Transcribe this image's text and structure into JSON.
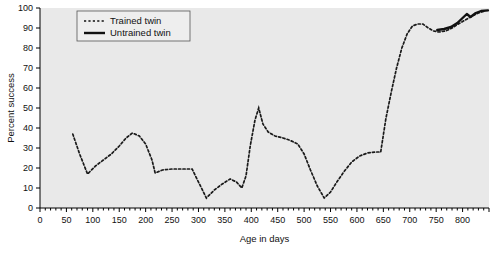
{
  "chart_data": {
    "type": "line",
    "title": "",
    "xlabel": "Age in days",
    "ylabel": "Percent success",
    "xlim": [
      0,
      850
    ],
    "ylim": [
      0,
      100
    ],
    "xticks": [
      0,
      50,
      100,
      150,
      200,
      250,
      300,
      350,
      400,
      450,
      500,
      550,
      600,
      650,
      700,
      750,
      800
    ],
    "yticks": [
      0,
      10,
      20,
      30,
      40,
      50,
      60,
      70,
      80,
      90,
      100
    ],
    "grid": false,
    "legend_position": "top-left",
    "plot_background": "#e9e9e9",
    "series": [
      {
        "name": "Trained twin",
        "style": "dashed",
        "color": "#1a1a1a",
        "points": [
          [
            62,
            37
          ],
          [
            75,
            27
          ],
          [
            90,
            17
          ],
          [
            105,
            21
          ],
          [
            120,
            24
          ],
          [
            135,
            27
          ],
          [
            150,
            31
          ],
          [
            163,
            35
          ],
          [
            175,
            37.5
          ],
          [
            188,
            36
          ],
          [
            200,
            32
          ],
          [
            212,
            24
          ],
          [
            218,
            17.5
          ],
          [
            232,
            19
          ],
          [
            250,
            19.5
          ],
          [
            270,
            19.5
          ],
          [
            288,
            19.5
          ],
          [
            300,
            13
          ],
          [
            315,
            5
          ],
          [
            330,
            9
          ],
          [
            345,
            12
          ],
          [
            360,
            14.5
          ],
          [
            372,
            13
          ],
          [
            382,
            10
          ],
          [
            390,
            16
          ],
          [
            398,
            31
          ],
          [
            407,
            44
          ],
          [
            414,
            50
          ],
          [
            422,
            42
          ],
          [
            432,
            38
          ],
          [
            445,
            36
          ],
          [
            460,
            35
          ],
          [
            472,
            34
          ],
          [
            488,
            32
          ],
          [
            500,
            27
          ],
          [
            512,
            19
          ],
          [
            525,
            11
          ],
          [
            538,
            5
          ],
          [
            550,
            8
          ],
          [
            562,
            13
          ],
          [
            575,
            18
          ],
          [
            590,
            23
          ],
          [
            605,
            26
          ],
          [
            620,
            27.5
          ],
          [
            635,
            28
          ],
          [
            645,
            28
          ],
          [
            655,
            45
          ],
          [
            665,
            58
          ],
          [
            675,
            70
          ],
          [
            685,
            80
          ],
          [
            695,
            87
          ],
          [
            705,
            91
          ],
          [
            715,
            92
          ],
          [
            725,
            92
          ],
          [
            735,
            90
          ],
          [
            745,
            88.5
          ],
          [
            755,
            88
          ],
          [
            768,
            88.5
          ],
          [
            780,
            90
          ],
          [
            792,
            92
          ],
          [
            805,
            94
          ],
          [
            818,
            96
          ],
          [
            830,
            97.5
          ],
          [
            842,
            98.5
          ]
        ]
      },
      {
        "name": "Untrained twin",
        "style": "solid",
        "color": "#111111",
        "points": [
          [
            752,
            89
          ],
          [
            765,
            89.5
          ],
          [
            778,
            90.5
          ],
          [
            790,
            92.5
          ],
          [
            800,
            95
          ],
          [
            808,
            97
          ],
          [
            815,
            95.5
          ],
          [
            825,
            97.5
          ],
          [
            835,
            98.5
          ],
          [
            848,
            98.8
          ]
        ]
      }
    ]
  },
  "legend": {
    "items": [
      {
        "label": "Trained twin",
        "style": "dashed"
      },
      {
        "label": "Untrained twin",
        "style": "solid"
      }
    ]
  }
}
